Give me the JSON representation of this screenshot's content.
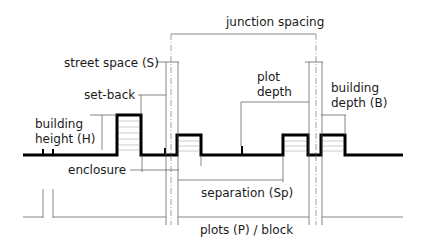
{
  "diagram": {
    "labels": {
      "junction_spacing": "junction spacing",
      "street_space": "street space (S)",
      "set_back": "set-back",
      "building_height_line1": "building",
      "building_height_line2": "height (H)",
      "plot_depth_line1": "plot",
      "plot_depth_line2": "depth",
      "building_depth_line1": "building",
      "building_depth_line2": "depth (B)",
      "enclosure": "enclosure",
      "separation": "separation (Sp)",
      "plots_block": "plots (P) / block"
    },
    "colors": {
      "outline": "#000000",
      "dimension_line": "#555555",
      "hatch": "#aaaaaa",
      "background": "#ffffff"
    }
  }
}
